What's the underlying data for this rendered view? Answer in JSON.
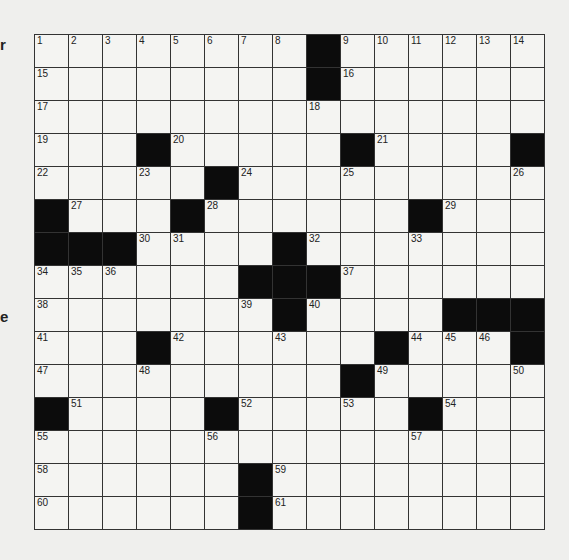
{
  "margin_fragments": [
    {
      "text": "r",
      "top": 36
    },
    {
      "text": "e",
      "top": 308
    }
  ],
  "puzzle": {
    "rows": 15,
    "cols": 15,
    "black_cells": [
      [
        0,
        8
      ],
      [
        1,
        8
      ],
      [
        3,
        3
      ],
      [
        3,
        9
      ],
      [
        3,
        14
      ],
      [
        4,
        5
      ],
      [
        5,
        0
      ],
      [
        5,
        4
      ],
      [
        5,
        11
      ],
      [
        6,
        0
      ],
      [
        6,
        1
      ],
      [
        6,
        2
      ],
      [
        6,
        7
      ],
      [
        7,
        6
      ],
      [
        7,
        7
      ],
      [
        7,
        8
      ],
      [
        8,
        7
      ],
      [
        8,
        12
      ],
      [
        8,
        13
      ],
      [
        8,
        14
      ],
      [
        9,
        3
      ],
      [
        9,
        10
      ],
      [
        9,
        14
      ],
      [
        10,
        9
      ],
      [
        11,
        0
      ],
      [
        11,
        5
      ],
      [
        11,
        11
      ],
      [
        13,
        6
      ],
      [
        14,
        6
      ]
    ],
    "numbers": [
      {
        "r": 0,
        "c": 0,
        "n": "1"
      },
      {
        "r": 0,
        "c": 1,
        "n": "2"
      },
      {
        "r": 0,
        "c": 2,
        "n": "3"
      },
      {
        "r": 0,
        "c": 3,
        "n": "4"
      },
      {
        "r": 0,
        "c": 4,
        "n": "5"
      },
      {
        "r": 0,
        "c": 5,
        "n": "6"
      },
      {
        "r": 0,
        "c": 6,
        "n": "7"
      },
      {
        "r": 0,
        "c": 7,
        "n": "8"
      },
      {
        "r": 0,
        "c": 9,
        "n": "9"
      },
      {
        "r": 0,
        "c": 10,
        "n": "10"
      },
      {
        "r": 0,
        "c": 11,
        "n": "11"
      },
      {
        "r": 0,
        "c": 12,
        "n": "12"
      },
      {
        "r": 0,
        "c": 13,
        "n": "13"
      },
      {
        "r": 0,
        "c": 14,
        "n": "14"
      },
      {
        "r": 1,
        "c": 0,
        "n": "15"
      },
      {
        "r": 1,
        "c": 9,
        "n": "16"
      },
      {
        "r": 2,
        "c": 0,
        "n": "17"
      },
      {
        "r": 2,
        "c": 8,
        "n": "18"
      },
      {
        "r": 3,
        "c": 0,
        "n": "19"
      },
      {
        "r": 3,
        "c": 4,
        "n": "20"
      },
      {
        "r": 3,
        "c": 10,
        "n": "21"
      },
      {
        "r": 4,
        "c": 0,
        "n": "22"
      },
      {
        "r": 4,
        "c": 3,
        "n": "23"
      },
      {
        "r": 4,
        "c": 6,
        "n": "24"
      },
      {
        "r": 4,
        "c": 9,
        "n": "25"
      },
      {
        "r": 4,
        "c": 14,
        "n": "26"
      },
      {
        "r": 5,
        "c": 1,
        "n": "27"
      },
      {
        "r": 5,
        "c": 5,
        "n": "28"
      },
      {
        "r": 5,
        "c": 12,
        "n": "29"
      },
      {
        "r": 6,
        "c": 3,
        "n": "30"
      },
      {
        "r": 6,
        "c": 4,
        "n": "31"
      },
      {
        "r": 6,
        "c": 8,
        "n": "32"
      },
      {
        "r": 6,
        "c": 11,
        "n": "33"
      },
      {
        "r": 7,
        "c": 0,
        "n": "34"
      },
      {
        "r": 7,
        "c": 1,
        "n": "35"
      },
      {
        "r": 7,
        "c": 2,
        "n": "36"
      },
      {
        "r": 7,
        "c": 9,
        "n": "37"
      },
      {
        "r": 8,
        "c": 0,
        "n": "38"
      },
      {
        "r": 8,
        "c": 6,
        "n": "39"
      },
      {
        "r": 8,
        "c": 8,
        "n": "40"
      },
      {
        "r": 9,
        "c": 0,
        "n": "41"
      },
      {
        "r": 9,
        "c": 4,
        "n": "42"
      },
      {
        "r": 9,
        "c": 7,
        "n": "43"
      },
      {
        "r": 9,
        "c": 11,
        "n": "44"
      },
      {
        "r": 9,
        "c": 12,
        "n": "45"
      },
      {
        "r": 9,
        "c": 13,
        "n": "46"
      },
      {
        "r": 10,
        "c": 0,
        "n": "47"
      },
      {
        "r": 10,
        "c": 3,
        "n": "48"
      },
      {
        "r": 10,
        "c": 10,
        "n": "49"
      },
      {
        "r": 10,
        "c": 14,
        "n": "50"
      },
      {
        "r": 11,
        "c": 1,
        "n": "51"
      },
      {
        "r": 11,
        "c": 6,
        "n": "52"
      },
      {
        "r": 11,
        "c": 9,
        "n": "53"
      },
      {
        "r": 11,
        "c": 12,
        "n": "54"
      },
      {
        "r": 12,
        "c": 0,
        "n": "55"
      },
      {
        "r": 12,
        "c": 5,
        "n": "56"
      },
      {
        "r": 12,
        "c": 11,
        "n": "57"
      },
      {
        "r": 13,
        "c": 0,
        "n": "58"
      },
      {
        "r": 13,
        "c": 7,
        "n": "59"
      },
      {
        "r": 14,
        "c": 0,
        "n": "60"
      },
      {
        "r": 14,
        "c": 7,
        "n": "61"
      }
    ],
    "entries": {}
  }
}
